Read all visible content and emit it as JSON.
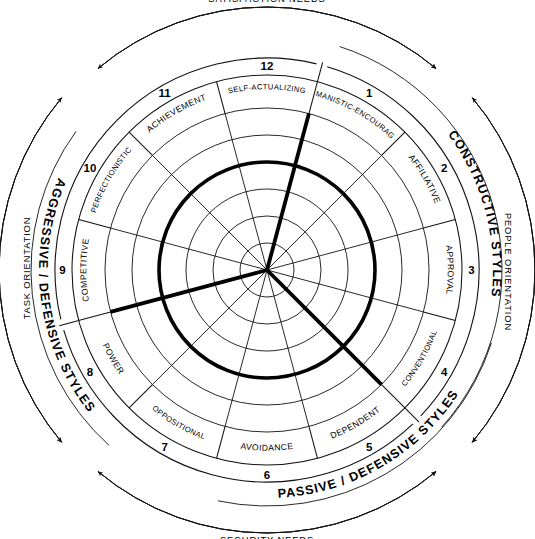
{
  "colors": {
    "ink": "#000000",
    "background": "#ffffff"
  },
  "bands": {
    "constructive": "CONSTRUCTIVE STYLES",
    "passive_defensive": "PASSIVE / DEFENSIVE STYLES",
    "aggressive_defensive": "AGGRESSIVE / DEFENSIVE STYLES"
  },
  "needs": {
    "satisfaction": "SATISFACTION NEEDS",
    "security": "SECURITY NEEDS"
  },
  "orientation": {
    "people": "PEOPLE ORIENTATION",
    "task": "TASK ORIENTATION"
  },
  "segments": [
    {
      "number": "1",
      "label": "HUMANISTIC-ENCOURAGING",
      "group": "constructive"
    },
    {
      "number": "2",
      "label": "AFFILIATIVE",
      "group": "constructive"
    },
    {
      "number": "3",
      "label": "APPROVAL",
      "group": "passive_defensive"
    },
    {
      "number": "4",
      "label": "CONVENTIONAL",
      "group": "passive_defensive"
    },
    {
      "number": "5",
      "label": "DEPENDENT",
      "group": "passive_defensive"
    },
    {
      "number": "6",
      "label": "AVOIDANCE",
      "group": "passive_defensive"
    },
    {
      "number": "7",
      "label": "OPPOSITIONAL",
      "group": "aggressive_defensive"
    },
    {
      "number": "8",
      "label": "POWER",
      "group": "aggressive_defensive"
    },
    {
      "number": "9",
      "label": "COMPETITIVE",
      "group": "aggressive_defensive"
    },
    {
      "number": "10",
      "label": "PERFECTIONISTIC",
      "group": "aggressive_defensive"
    },
    {
      "number": "11",
      "label": "ACHIEVEMENT",
      "group": "constructive"
    },
    {
      "number": "12",
      "label": "SELF-ACTUALIZING",
      "group": "constructive"
    }
  ],
  "chart_data": {
    "type": "radar",
    "categories": [
      "HUMANISTIC-ENCOURAGING",
      "AFFILIATIVE",
      "APPROVAL",
      "CONVENTIONAL",
      "DEPENDENT",
      "AVOIDANCE",
      "OPPOSITIONAL",
      "POWER",
      "COMPETITIVE",
      "PERFECTIONISTIC",
      "ACHIEVEMENT",
      "SELF-ACTUALIZING"
    ],
    "position_numbers": [
      "1",
      "2",
      "3",
      "4",
      "5",
      "6",
      "7",
      "8",
      "9",
      "10",
      "11",
      "12"
    ],
    "rings": 6,
    "ring_radii_px": [
      27,
      54,
      81,
      108,
      135,
      162
    ],
    "highlight_ring_index": 3,
    "outer_radius_px": 195,
    "label_ring_inner_px": 162,
    "number_ring_outer_px": 212,
    "grid": true,
    "legend": "none",
    "markers": [
      {
        "name": "boundary-11-10",
        "angle_deg": 135,
        "radius_px": 162,
        "style": "thick-radial"
      },
      {
        "name": "boundary-2-3",
        "angle_deg": 15,
        "radius_px": 162,
        "style": "thick-radial"
      },
      {
        "name": "boundary-7-6",
        "angle_deg": 255,
        "radius_px": 162,
        "style": "thick-radial"
      }
    ]
  }
}
